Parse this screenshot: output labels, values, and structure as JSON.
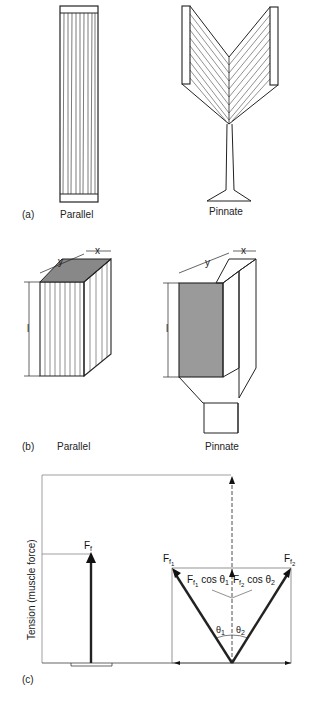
{
  "figure": {
    "panels": [
      {
        "id": "a",
        "tag": "(a)",
        "left_label": "Parallel",
        "right_label": "Pinnate"
      },
      {
        "id": "b",
        "tag": "(b)",
        "left_label": "Parallel",
        "right_label": "Pinnate",
        "dimension_labels": {
          "width": "x",
          "depth": "y",
          "length": "l"
        }
      },
      {
        "id": "c",
        "tag": "(c)",
        "y_axis_label": "Tension (muscle force)",
        "labels": {
          "parallel_force": "F",
          "parallel_force_sub": "f",
          "pinnate_force_1": "F",
          "pinnate_force_1_sub": "f",
          "pinnate_force_1_subsub": "1",
          "pinnate_force_2": "F",
          "pinnate_force_2_sub": "f",
          "pinnate_force_2_subsub": "2",
          "component_1": " cos θ",
          "component_1_idx": "1",
          "component_2": " cos θ",
          "component_2_idx": "2",
          "angle_1": "θ",
          "angle_1_idx": "1",
          "angle_2": "θ",
          "angle_2_idx": "2"
        }
      }
    ]
  }
}
